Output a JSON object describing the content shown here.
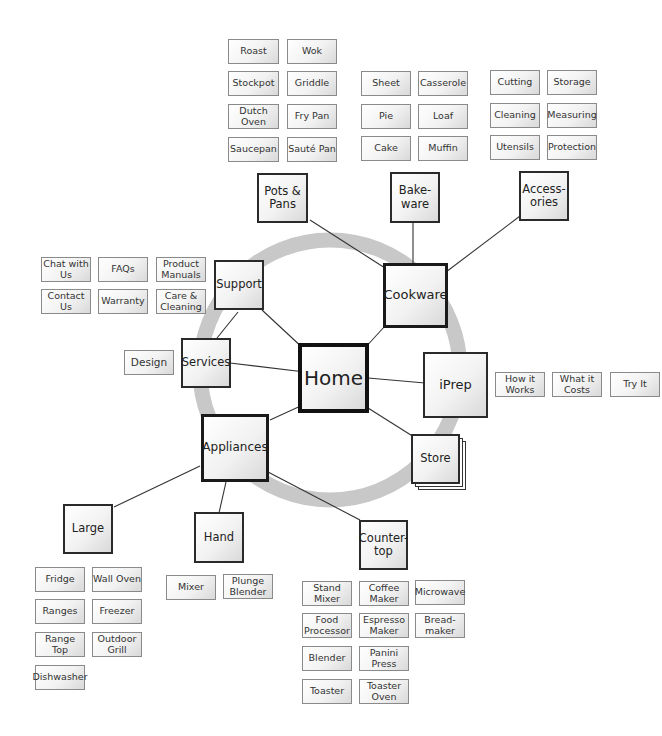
{
  "diagram": {
    "type": "site-map",
    "ring_color": "#c8c8c8",
    "line_color": "#333333",
    "nodes": {
      "home": {
        "label": "Home"
      },
      "cookware": {
        "label": "Cookware"
      },
      "iprep": {
        "label": "iPrep"
      },
      "store": {
        "label": "Store"
      },
      "appliances": {
        "label": "Appliances"
      },
      "services": {
        "label": "Services"
      },
      "support": {
        "label": "Support"
      },
      "pots_pans": {
        "label": "Pots & Pans"
      },
      "bakeware": {
        "label": "Bake-ware"
      },
      "accessories": {
        "label": "Access-ories"
      },
      "large": {
        "label": "Large"
      },
      "hand": {
        "label": "Hand"
      },
      "countertop": {
        "label": "Counter-top"
      }
    },
    "pots_pans_items": [
      "Roast",
      "Wok",
      "Stockpot",
      "Griddle",
      "Dutch Oven",
      "Fry Pan",
      "Saucepan",
      "Sauté Pan"
    ],
    "bakeware_items": [
      "Sheet",
      "Casserole",
      "Pie",
      "Loaf",
      "Cake",
      "Muffin"
    ],
    "accessories_items": [
      "Cutting",
      "Storage",
      "Cleaning",
      "Measuring",
      "Utensils",
      "Protection"
    ],
    "support_items": [
      "Chat with Us",
      "FAQs",
      "Product Manuals",
      "Contact Us",
      "Warranty",
      "Care & Cleaning"
    ],
    "services_items": [
      "Design"
    ],
    "iprep_items": [
      "How it Works",
      "What it Costs",
      "Try It"
    ],
    "large_items": [
      "Fridge",
      "Wall Oven",
      "Ranges",
      "Freezer",
      "Range Top",
      "Outdoor Grill",
      "Dishwasher"
    ],
    "hand_items": [
      "Mixer",
      "Plunge Blender"
    ],
    "countertop_items": [
      "Stand Mixer",
      "Coffee Maker",
      "Microwave",
      "Food Processor",
      "Espresso Maker",
      "Bread-maker",
      "Blender",
      "Panini Press",
      "Toaster",
      "Toaster Oven"
    ]
  }
}
